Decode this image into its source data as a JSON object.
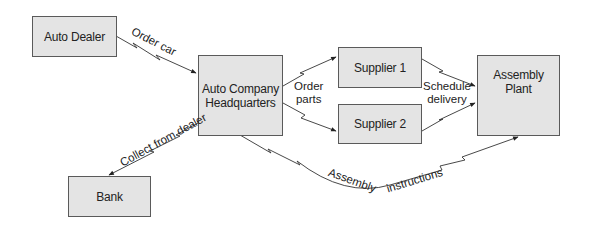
{
  "diagram": {
    "nodes": {
      "auto_dealer": "Auto Dealer",
      "hq": "Auto Company\nHeadquarters",
      "supplier1": "Supplier 1",
      "supplier2": "Supplier 2",
      "assembly_plant": "Assembly\nPlant",
      "bank": "Bank"
    },
    "edges": {
      "order_car": "Order car",
      "order_parts": "Order\nparts",
      "schedule_delivery": "Schedule\ndelivery",
      "collect_from_dealer": "Collect from dealer",
      "assembly": "Assembly",
      "instructions": "instructions"
    },
    "colors": {
      "box_fill": "#e4e4e4",
      "box_border": "#5a5a5a",
      "line": "#333333"
    }
  }
}
